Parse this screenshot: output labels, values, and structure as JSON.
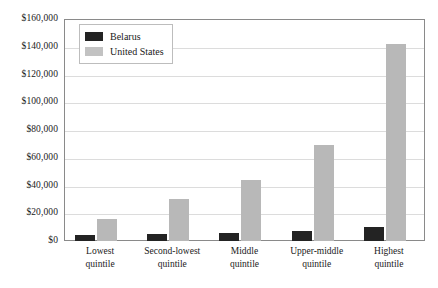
{
  "chart_data": {
    "type": "bar",
    "title": "",
    "subtitle": "",
    "xlabel": "",
    "ylabel": "",
    "categories": [
      "Lowest quintile",
      "Second-lowest quintile",
      "Middle quintile",
      "Upper-middle quintile",
      "Highest quintile"
    ],
    "category_lines": [
      [
        "Lowest",
        "quintile"
      ],
      [
        "Second-lowest",
        "quintile"
      ],
      [
        "Middle",
        "quintile"
      ],
      [
        "Upper-middle",
        "quintile"
      ],
      [
        "Highest",
        "quintile"
      ]
    ],
    "series": [
      {
        "name": "Belarus",
        "color": "#232323",
        "values": [
          4500,
          4800,
          6000,
          7500,
          10000
        ]
      },
      {
        "name": "United States",
        "color": "#b8b8b8",
        "values": [
          16000,
          30000,
          44000,
          69000,
          142000
        ]
      }
    ],
    "ylim": [
      0,
      160000
    ],
    "ytick_values": [
      0,
      20000,
      40000,
      60000,
      80000,
      100000,
      120000,
      140000,
      160000
    ],
    "ytick_labels": [
      "$0",
      "$20,000",
      "$40,000",
      "$60,000",
      "$80,000",
      "$100,000",
      "$120,000",
      "$140,000",
      "$160,000"
    ],
    "grid": true,
    "grid_axis": "y",
    "legend_position": "top-left-inside",
    "legend_entries": [
      "Belarus",
      "United States"
    ]
  },
  "legend": {
    "items": [
      {
        "label": "Belarus"
      },
      {
        "label": "United States"
      }
    ]
  }
}
